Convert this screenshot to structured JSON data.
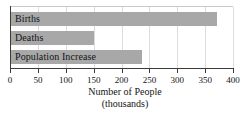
{
  "chart_data": {
    "type": "bar",
    "orientation": "horizontal",
    "title": "",
    "xlabel": "Number of People",
    "xlabel_sub": "(thousands)",
    "ylabel": "",
    "categories": [
      "Births",
      "Deaths",
      "Population Increase"
    ],
    "values": [
      370,
      148,
      235
    ],
    "xlim": [
      0,
      400
    ],
    "xticks": [
      0,
      50,
      100,
      150,
      200,
      250,
      300,
      350,
      400
    ],
    "xtick_labels": [
      "0",
      "50",
      "100",
      "150",
      "200",
      "250",
      "300",
      "350",
      "400"
    ],
    "grid": true,
    "legend": null,
    "bar_color": "#a8a8a8",
    "axis_color": "#3a3a3a",
    "gridline_color": "#dcdcdc",
    "label_color": "#141414"
  }
}
